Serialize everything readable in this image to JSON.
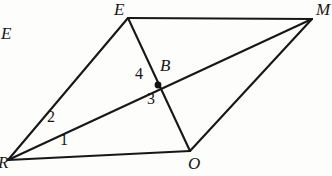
{
  "figure": {
    "background_color": "#fdfdfb",
    "stroke_color": "#171717",
    "label_color": "#161616"
  },
  "vertices": [
    {
      "id": "R",
      "label": "R",
      "x": 8,
      "y": 160,
      "label_x": -2,
      "label_y": 154
    },
    {
      "id": "E",
      "label": "E",
      "x": 128,
      "y": 18,
      "label_x": 114,
      "label_y": 1
    },
    {
      "id": "M",
      "label": "M",
      "x": 312,
      "y": 19,
      "label_x": 316,
      "label_y": 1
    },
    {
      "id": "O",
      "label": "O",
      "x": 190,
      "y": 151,
      "label_x": 188,
      "label_y": 155
    },
    {
      "id": "B",
      "label": "B",
      "x": 158,
      "y": 85,
      "label_x": 160,
      "label_y": 57
    }
  ],
  "stray_label": {
    "text": "E",
    "x": 1,
    "y": 25
  },
  "edges": [
    {
      "name": "edge-R-E",
      "from": "R",
      "to": "E"
    },
    {
      "name": "edge-E-M",
      "from": "E",
      "to": "M"
    },
    {
      "name": "edge-R-O",
      "from": "R",
      "to": "O"
    },
    {
      "name": "edge-O-M",
      "from": "O",
      "to": "M"
    },
    {
      "name": "diagonal-R-M",
      "from": "R",
      "to": "M"
    },
    {
      "name": "segment-E-O",
      "from": "E",
      "to": "O"
    }
  ],
  "intersection_point": {
    "id": "B",
    "x": 158,
    "y": 85,
    "radius": 3.4
  },
  "angle_labels": [
    {
      "id": "1",
      "text": "1",
      "x": 60,
      "y": 132
    },
    {
      "id": "2",
      "text": "2",
      "x": 47,
      "y": 109
    },
    {
      "id": "3",
      "text": "3",
      "x": 147,
      "y": 91
    },
    {
      "id": "4",
      "text": "4",
      "x": 135,
      "y": 66
    }
  ]
}
